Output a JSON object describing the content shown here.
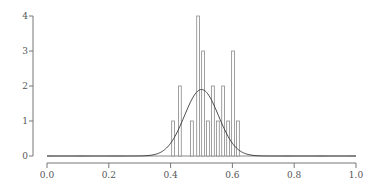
{
  "chart_data": {
    "type": "bar",
    "title": "",
    "xlabel": "",
    "ylabel": "",
    "xlim": [
      0.0,
      1.0
    ],
    "ylim": [
      0,
      4
    ],
    "grid": false,
    "legend": null,
    "x_ticks": [
      "0.0",
      "0.2",
      "0.4",
      "0.6",
      "0.8",
      "1.0"
    ],
    "y_ticks": [
      "0",
      "1",
      "2",
      "3",
      "4"
    ],
    "bar_width": 0.009,
    "bars": [
      {
        "x": 0.408,
        "height": 1
      },
      {
        "x": 0.43,
        "height": 2
      },
      {
        "x": 0.469,
        "height": 1
      },
      {
        "x": 0.489,
        "height": 4
      },
      {
        "x": 0.505,
        "height": 3
      },
      {
        "x": 0.521,
        "height": 1
      },
      {
        "x": 0.537,
        "height": 2
      },
      {
        "x": 0.553,
        "height": 1
      },
      {
        "x": 0.57,
        "height": 2
      },
      {
        "x": 0.586,
        "height": 1
      },
      {
        "x": 0.602,
        "height": 3
      },
      {
        "x": 0.618,
        "height": 1
      }
    ],
    "overlay_curve": {
      "type": "normal",
      "mean": 0.5,
      "sd": 0.055,
      "peak": 1.9
    }
  },
  "colors": {
    "bar_stroke": "#888888",
    "bar_fill": "#ffffff",
    "curve": "#333333",
    "axis": "#777777",
    "baseline": "#888888"
  }
}
